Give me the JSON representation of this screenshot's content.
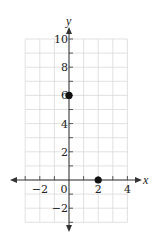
{
  "chart_data": {
    "type": "scatter",
    "title": "",
    "xlabel": "x",
    "ylabel": "y",
    "xlim": [
      -3,
      4
    ],
    "ylim": [
      -3,
      10
    ],
    "grid": true,
    "x_tick_labels": [
      {
        "value": -2,
        "label": "−2"
      },
      {
        "value": 0,
        "label": "0"
      },
      {
        "value": 2,
        "label": "2"
      },
      {
        "value": 4,
        "label": "4"
      }
    ],
    "y_tick_labels": [
      {
        "value": 10,
        "label": "10"
      },
      {
        "value": 8,
        "label": "8"
      },
      {
        "value": 6,
        "label": "6"
      },
      {
        "value": 4,
        "label": "4"
      },
      {
        "value": 2,
        "label": "2"
      },
      {
        "value": -2,
        "label": "−2"
      }
    ],
    "series": [
      {
        "name": "points",
        "points": [
          {
            "x": 0,
            "y": 6
          },
          {
            "x": 2,
            "y": 0
          }
        ]
      }
    ],
    "colors": {
      "grid": "#d9d9d9",
      "axis": "#333333",
      "point": "#111111"
    }
  },
  "labels": {
    "x_axis": "x",
    "y_axis": "y"
  }
}
